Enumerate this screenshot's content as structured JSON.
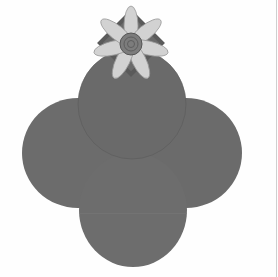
{
  "image": {
    "subject": "Petal envelope with flower embellishment",
    "colors": {
      "background": "#fefefe",
      "envelope": "#6b6b6b",
      "envelope_shadow": "#5e5e5e",
      "petals": "#cfcfcf",
      "flower_center": "#7a7a7a",
      "ribbon_square": "#575757"
    }
  }
}
